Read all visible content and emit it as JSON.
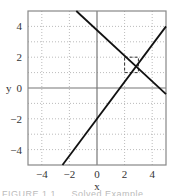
{
  "chart_data": {
    "type": "line",
    "title": "",
    "xlabel": "x",
    "ylabel": "y",
    "xlim": [
      -5,
      5
    ],
    "ylim": [
      -5,
      5
    ],
    "grid": true,
    "x_ticks": [
      -4,
      -2,
      0,
      2,
      4
    ],
    "y_ticks": [
      4,
      2,
      0,
      -2,
      -4
    ],
    "x_tick_labels": [
      "−4",
      "−2",
      "0",
      "2",
      "4"
    ],
    "y_tick_labels": [
      "4",
      "2",
      "0",
      "−2",
      "−4"
    ],
    "series": [
      {
        "name": "line-decreasing",
        "x": [
          -1.5,
          5
        ],
        "y": [
          5,
          -0.4
        ]
      },
      {
        "name": "line-increasing",
        "x": [
          -2.5,
          5
        ],
        "y": [
          -5,
          4
        ]
      }
    ],
    "annotations": [
      {
        "type": "dashed-box",
        "x": [
          2,
          3
        ],
        "y": [
          1,
          2
        ],
        "note": "region around intersection"
      }
    ],
    "intersection": {
      "x": 2.8,
      "y": 1.4
    }
  },
  "caption": "FIGURE 1.1 … Solved Example"
}
